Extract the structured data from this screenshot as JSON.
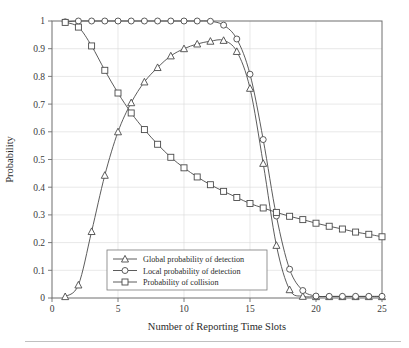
{
  "figure": {
    "background": "#ffffff",
    "frame_color": "#6e6e6e",
    "grid_color": "#d9d9d9",
    "line_color": "#4a4a4a"
  },
  "axes": {
    "ylabel": "Probability",
    "xlabel": "Number of Reporting Time Slots",
    "xticks": [
      "0",
      "5",
      "10",
      "15",
      "20",
      "25"
    ],
    "yticks": [
      "0",
      "0.1",
      "0.2",
      "0.3",
      "0.4",
      "0.5",
      "0.6",
      "0.7",
      "0.8",
      "0.9",
      "1"
    ]
  },
  "legend": {
    "position": "lower-center-left",
    "entries": [
      {
        "label": "Global probability of detection",
        "marker": "triangle"
      },
      {
        "label": "Local probability of detection",
        "marker": "circle"
      },
      {
        "label": "Probability of collision",
        "marker": "square"
      }
    ]
  },
  "chart_data": {
    "type": "line",
    "title": "",
    "xlabel": "Number of Reporting Time Slots",
    "ylabel": "Probability",
    "xlim": [
      0,
      25
    ],
    "ylim": [
      0,
      1
    ],
    "grid": true,
    "legend_position": "lower center-left",
    "x": [
      1,
      2,
      3,
      4,
      5,
      6,
      7,
      8,
      9,
      10,
      11,
      12,
      13,
      14,
      15,
      16,
      17,
      18,
      19,
      20,
      21,
      22,
      23,
      24,
      25
    ],
    "series": [
      {
        "name": "Global probability of detection",
        "marker": "triangle",
        "values": [
          0.005,
          0.047,
          0.24,
          0.443,
          0.6,
          0.705,
          0.78,
          0.832,
          0.874,
          0.9,
          0.917,
          0.927,
          0.93,
          0.89,
          0.757,
          0.486,
          0.19,
          0.03,
          0.006,
          0.005,
          0.005,
          0.005,
          0.005,
          0.005,
          0.005
        ]
      },
      {
        "name": "Local probability of detection",
        "marker": "circle",
        "values": [
          0.997,
          1.0,
          1.0,
          1.0,
          1.0,
          1.0,
          1.0,
          1.0,
          1.0,
          1.0,
          1.0,
          0.999,
          0.985,
          0.935,
          0.808,
          0.572,
          0.296,
          0.104,
          0.027,
          0.007,
          0.006,
          0.006,
          0.006,
          0.006,
          0.006
        ]
      },
      {
        "name": "Probability of collision",
        "marker": "square",
        "values": [
          0.995,
          0.978,
          0.91,
          0.822,
          0.74,
          0.668,
          0.608,
          0.555,
          0.508,
          0.47,
          0.437,
          0.409,
          0.385,
          0.363,
          0.341,
          0.325,
          0.309,
          0.295,
          0.283,
          0.27,
          0.259,
          0.249,
          0.238,
          0.23,
          0.221
        ]
      }
    ]
  }
}
